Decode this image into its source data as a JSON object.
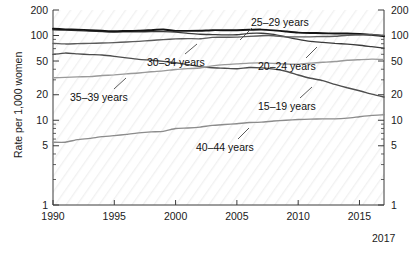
{
  "chart_data": {
    "type": "line",
    "title": "",
    "xlabel": "",
    "ylabel": "Rate per 1,000 women",
    "xlim": [
      1990,
      2017
    ],
    "ylim": [
      1,
      200
    ],
    "yscale": "log",
    "grid": false,
    "legend_position": "inline-annotations",
    "x": [
      1990,
      1991,
      1992,
      1993,
      1994,
      1995,
      1996,
      1997,
      1998,
      1999,
      2000,
      2001,
      2002,
      2003,
      2004,
      2005,
      2006,
      2007,
      2008,
      2009,
      2010,
      2011,
      2012,
      2013,
      2014,
      2015,
      2016,
      2017
    ],
    "series": [
      {
        "name": "15-19 years",
        "label": "15–19 years",
        "color": "#4d4d4d",
        "values": [
          59.9,
          62.1,
          60.7,
          59.6,
          58.9,
          56.8,
          54.4,
          52.3,
          51.1,
          49.6,
          47.7,
          45.3,
          43.0,
          41.6,
          41.1,
          40.5,
          41.9,
          41.5,
          40.2,
          37.9,
          34.2,
          31.3,
          29.4,
          26.5,
          24.2,
          22.3,
          20.3,
          18.8
        ]
      },
      {
        "name": "20-24 years",
        "label": "20–24 years",
        "color": "#3a3a3a",
        "values": [
          116.5,
          115.7,
          114.6,
          112.6,
          111.1,
          109.8,
          110.4,
          110.4,
          111.2,
          111.0,
          109.7,
          106.2,
          103.6,
          102.6,
          101.7,
          102.2,
          105.9,
          106.3,
          103.0,
          96.3,
          90.0,
          85.3,
          83.1,
          80.7,
          79.0,
          76.8,
          73.8,
          71.0
        ]
      },
      {
        "name": "25-29 years",
        "label": "25–29 years",
        "color": "#141414",
        "values": [
          120.2,
          118.2,
          117.4,
          115.5,
          113.9,
          112.2,
          113.1,
          113.8,
          115.9,
          117.8,
          113.5,
          113.4,
          113.6,
          115.6,
          115.5,
          115.5,
          116.8,
          117.5,
          115.1,
          111.5,
          108.3,
          107.2,
          106.5,
          105.5,
          105.8,
          104.3,
          101.9,
          98.0
        ]
      },
      {
        "name": "30-34 years",
        "label": "30–34 years",
        "color": "#5c5c5c",
        "values": [
          80.8,
          79.5,
          80.2,
          80.8,
          81.5,
          82.5,
          83.9,
          85.3,
          87.4,
          89.6,
          91.2,
          91.9,
          91.5,
          95.1,
          95.3,
          95.8,
          97.7,
          99.3,
          99.3,
          96.5,
          96.5,
          96.5,
          97.3,
          98.0,
          100.8,
          101.5,
          102.6,
          100.3
        ]
      },
      {
        "name": "35-39 years",
        "label": "35–39 years",
        "color": "#9a9a9a",
        "values": [
          31.7,
          32.0,
          32.5,
          32.7,
          33.7,
          34.3,
          35.3,
          36.1,
          37.4,
          38.3,
          39.7,
          40.6,
          41.4,
          43.8,
          45.4,
          46.3,
          47.3,
          47.5,
          46.9,
          46.1,
          45.9,
          47.2,
          48.3,
          49.3,
          51.0,
          51.8,
          52.6,
          52.2
        ]
      },
      {
        "name": "40-44 years",
        "label": "40–44 years",
        "color": "#8c8c8c",
        "values": [
          5.5,
          5.5,
          5.9,
          6.1,
          6.4,
          6.6,
          6.8,
          7.1,
          7.3,
          7.4,
          8.0,
          8.1,
          8.3,
          8.7,
          8.9,
          9.1,
          9.4,
          9.5,
          9.8,
          10.0,
          10.2,
          10.3,
          10.4,
          10.4,
          10.6,
          11.0,
          11.4,
          11.6
        ]
      }
    ],
    "y_ticks": [
      1,
      5,
      10,
      20,
      50,
      100,
      200
    ],
    "y_tick_labels": [
      "1",
      "5",
      "10",
      "20",
      "50",
      "100",
      "200"
    ],
    "x_ticks": [
      1990,
      1995,
      2000,
      2005,
      2010,
      2015
    ],
    "x_tick_labels": [
      "1990",
      "1995",
      "2000",
      "2005",
      "2010",
      "2015"
    ],
    "x_end_label": "2017",
    "annotations": [
      {
        "text": "25–29 years",
        "x": 251,
        "y": 17
      },
      {
        "text": "30–34 years",
        "x": 147,
        "y": 57
      },
      {
        "text": "20–24 years",
        "x": 258,
        "y": 61
      },
      {
        "text": "35–39 years",
        "x": 70,
        "y": 92
      },
      {
        "text": "15–19 years",
        "x": 258,
        "y": 101
      },
      {
        "text": "40–44 years",
        "x": 196,
        "y": 142
      }
    ]
  },
  "axes": {
    "ylabel": "Rate per 1,000 women"
  }
}
